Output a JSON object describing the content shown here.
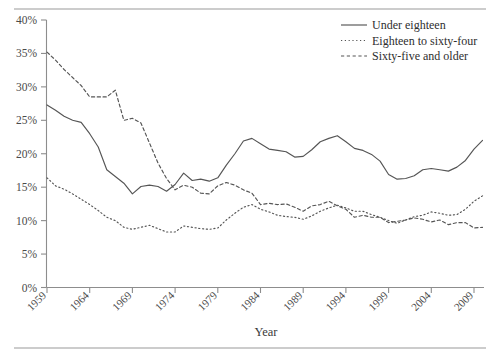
{
  "figure": {
    "top_rule": true,
    "bottom_rule": true
  },
  "axes": {
    "x_title": "Year",
    "y_title": "",
    "y_ticks": [
      "0%",
      "5%",
      "10%",
      "15%",
      "20%",
      "25%",
      "30%",
      "35%",
      "40%"
    ],
    "x_ticks": [
      "1959",
      "1964",
      "1969",
      "1974",
      "1979",
      "1984",
      "1989",
      "1994",
      "1999",
      "2004",
      "2009"
    ]
  },
  "legend": {
    "position": "top-right",
    "items": [
      {
        "label": "Under eighteen",
        "style": "solid"
      },
      {
        "label": "Eighteen to sixty-four",
        "style": "dotted"
      },
      {
        "label": "Sixty-five and older",
        "style": "dashed"
      }
    ]
  },
  "colors": {
    "line": "#555555",
    "axis": "#8d8d8d",
    "text": "#3a3a3a",
    "background": "#ffffff"
  },
  "chart_data": {
    "type": "line",
    "title": "",
    "xlabel": "Year",
    "ylabel": "",
    "xlim": [
      1959,
      2010
    ],
    "ylim": [
      0,
      40
    ],
    "ytick_step": 5,
    "ytick_format": "percent",
    "grid": false,
    "legend_position": "top-right",
    "x": [
      1959,
      1960,
      1961,
      1962,
      1963,
      1964,
      1965,
      1966,
      1967,
      1968,
      1969,
      1970,
      1971,
      1972,
      1973,
      1974,
      1975,
      1976,
      1977,
      1978,
      1979,
      1980,
      1981,
      1982,
      1983,
      1984,
      1985,
      1986,
      1987,
      1988,
      1989,
      1990,
      1991,
      1992,
      1993,
      1994,
      1995,
      1996,
      1997,
      1998,
      1999,
      2000,
      2001,
      2002,
      2003,
      2004,
      2005,
      2006,
      2007,
      2008,
      2009,
      2010
    ],
    "series": [
      {
        "name": "Under eighteen",
        "style": "solid",
        "values": [
          27.3,
          26.5,
          25.6,
          25.0,
          24.7,
          23.0,
          21.0,
          17.6,
          16.6,
          15.6,
          14.0,
          15.1,
          15.3,
          15.1,
          14.4,
          15.4,
          17.1,
          16.0,
          16.2,
          15.9,
          16.4,
          18.3,
          20.0,
          21.9,
          22.3,
          21.5,
          20.7,
          20.5,
          20.3,
          19.5,
          19.6,
          20.6,
          21.8,
          22.3,
          22.7,
          21.8,
          20.8,
          20.5,
          19.9,
          18.9,
          16.9,
          16.2,
          16.3,
          16.7,
          17.6,
          17.8,
          17.6,
          17.4,
          18.0,
          19.0,
          20.7,
          22.0
        ]
      },
      {
        "name": "Eighteen to sixty-four",
        "style": "dotted",
        "values": [
          16.4,
          15.2,
          14.7,
          14.0,
          13.2,
          12.4,
          11.5,
          10.5,
          10.0,
          9.0,
          8.7,
          9.0,
          9.3,
          8.8,
          8.3,
          8.3,
          9.2,
          9.0,
          8.8,
          8.7,
          8.9,
          10.1,
          11.1,
          12.0,
          12.4,
          11.7,
          11.3,
          10.8,
          10.6,
          10.5,
          10.2,
          10.7,
          11.4,
          11.9,
          12.3,
          11.9,
          11.4,
          11.4,
          10.9,
          10.5,
          10.0,
          9.6,
          10.1,
          10.6,
          10.8,
          11.3,
          11.1,
          10.8,
          10.9,
          11.7,
          12.9,
          13.7
        ]
      },
      {
        "name": "Sixty-five and older",
        "style": "dashed",
        "values": [
          35.2,
          34.0,
          32.6,
          31.4,
          30.2,
          28.5,
          28.5,
          28.5,
          29.5,
          25.0,
          25.3,
          24.6,
          21.6,
          18.6,
          16.3,
          14.6,
          15.3,
          15.0,
          14.1,
          14.0,
          15.2,
          15.7,
          15.3,
          14.6,
          14.1,
          12.4,
          12.6,
          12.4,
          12.5,
          12.0,
          11.4,
          12.2,
          12.4,
          12.9,
          12.2,
          11.7,
          10.5,
          10.8,
          10.5,
          10.5,
          9.7,
          9.9,
          10.1,
          10.4,
          10.2,
          9.8,
          10.1,
          9.4,
          9.7,
          9.7,
          8.9,
          9.0
        ]
      }
    ]
  }
}
